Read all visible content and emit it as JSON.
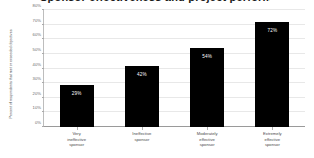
{
  "chart_data": {
    "type": "bar",
    "title": "Sponsor effectiveness and project performance",
    "xlabel": "",
    "ylabel": "Percent of respondents that met or exceeded objectives",
    "categories": [
      "Very ineffective sponsor",
      "Ineffective sponsor",
      "Moderately effective sponsor",
      "Extremely effective sponsor"
    ],
    "category_lines": [
      [
        "Very",
        "ineffective",
        "sponsor"
      ],
      [
        "Ineffective",
        "sponsor"
      ],
      [
        "Moderately",
        "effective",
        "sponsor"
      ],
      [
        "Extremely",
        "effective",
        "sponsor"
      ]
    ],
    "values": [
      29,
      42,
      54,
      72
    ],
    "value_labels": [
      "29%",
      "42%",
      "54%",
      "72%"
    ],
    "ylim": [
      0,
      80
    ],
    "ytick_values": [
      0,
      10,
      20,
      30,
      40,
      50,
      60,
      70,
      80
    ],
    "ytick_labels": [
      "0%",
      "10%",
      "20%",
      "30%",
      "40%",
      "50%",
      "60%",
      "70%",
      "80%"
    ],
    "grid": true,
    "legend": false,
    "bar_color": "#000000",
    "gridline_color": "#e8e8e8",
    "axis_color": "#9a9a9a",
    "value_label_color": "#ffffff"
  }
}
